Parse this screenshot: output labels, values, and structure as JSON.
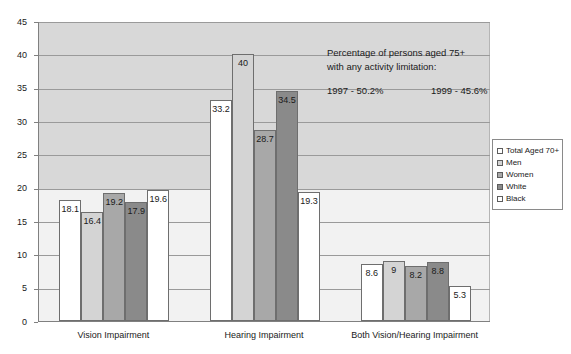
{
  "chart_data": {
    "type": "bar",
    "title": "",
    "xlabel": "",
    "ylabel": "",
    "ylim": [
      0,
      45
    ],
    "ytick_step": 5,
    "yticks": [
      "0",
      "5",
      "10",
      "15",
      "20",
      "25",
      "30",
      "35",
      "40",
      "45"
    ],
    "grid": true,
    "legend_position": "right",
    "categories": [
      "Vision Impairment",
      "Hearing Impairment",
      "Both Vision/Hearing Impairment"
    ],
    "series": [
      {
        "name": "Total Aged 70+",
        "color": "#ffffff",
        "values": [
          18.1,
          33.2,
          8.6
        ],
        "labels": [
          "18.1",
          "33.2",
          "8.6"
        ]
      },
      {
        "name": "Men",
        "color": "#d4d4d4",
        "values": [
          16.4,
          40,
          9
        ],
        "labels": [
          "16.4",
          "40",
          "9"
        ]
      },
      {
        "name": "Women",
        "color": "#a8a8a8",
        "values": [
          19.2,
          28.7,
          8.2
        ],
        "labels": [
          "19.2",
          "28.7",
          "8.2"
        ]
      },
      {
        "name": "White",
        "color": "#8a8a8a",
        "values": [
          17.9,
          34.5,
          8.8
        ],
        "labels": [
          "17.9",
          "34.5",
          "8.8"
        ]
      },
      {
        "name": "Black",
        "color": "#ffffff",
        "values": [
          19.6,
          19.3,
          5.3
        ],
        "labels": [
          "19.6",
          "19.3",
          "5.3"
        ]
      }
    ]
  },
  "annotation": {
    "line1": "Percentage of persons aged 75+",
    "line2": "with any activity limitation:",
    "stat_1997": "1997 - 50.2%",
    "stat_1999": "1999 - 45.6%"
  }
}
